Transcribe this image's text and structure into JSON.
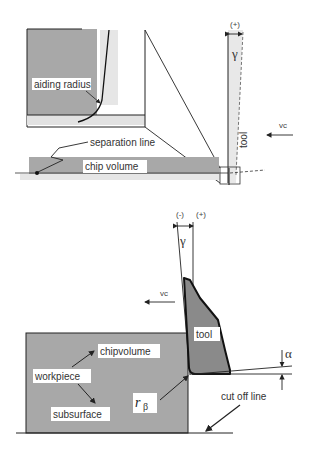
{
  "colors": {
    "workpiece_fill": "#a8a8a8",
    "tool_fill": "#8a8a8a",
    "light_band": "#e0e0e0",
    "stroke": "#222222",
    "label_bg": "#ffffff"
  },
  "top_figure": {
    "labels": {
      "aiding_radius": "aiding radius",
      "separation_line": "separation line",
      "chip_volume": "chip volume",
      "tool": "tool",
      "vc": "vc",
      "gamma": "γ",
      "sign_plus": "(+)"
    }
  },
  "bottom_figure": {
    "labels": {
      "sign_minus": "(-)",
      "sign_plus": "(+)",
      "gamma": "γ",
      "vc": "vc",
      "tool": "tool",
      "alpha": "α",
      "chipvolume": "chipvolume",
      "workpiece": "workpiece",
      "subsurface": "subsurface",
      "r": "r",
      "beta": "β",
      "cut_off_line": "cut off line"
    }
  }
}
